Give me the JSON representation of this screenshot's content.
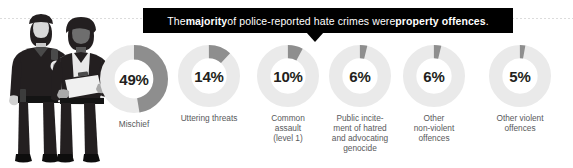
{
  "banner": {
    "prefix": "The ",
    "bold1": "majority",
    "middle": " of police-reported hate crimes were ",
    "bold2": "property offences",
    "suffix": "."
  },
  "illustration": {
    "name": "two-police-officers-illustration",
    "officer_left": "male police officer with badge and radio",
    "officer_right": "female police officer holding clipboard"
  },
  "colors": {
    "banner_background": "#000000",
    "banner_text": "#ffffff",
    "arc_active": "#8e8e8e",
    "arc_track": "#eaeaea",
    "percent_text": "#231f20",
    "label_text": "#58595b"
  },
  "chart_data": {
    "type": "pie",
    "title": "The majority of police-reported hate crimes were property offences.",
    "legend_position": "below-each",
    "unit": "%",
    "categories": [
      "Mischief",
      "Uttering threats",
      "Common assault (level 1)",
      "Public incitement of hatred and advocating genocide",
      "Other non-violent offences",
      "Other violent offences"
    ],
    "values": [
      49,
      14,
      10,
      6,
      6,
      5
    ],
    "donuts": [
      {
        "value": 49,
        "value_text": "49%",
        "label_lines": [
          "Mischief"
        ],
        "cx": 134,
        "size": 68
      },
      {
        "value": 14,
        "value_text": "14%",
        "label_lines": [
          "Uttering threats"
        ],
        "cx": 209,
        "size": 62
      },
      {
        "value": 10,
        "value_text": "10%",
        "label_lines": [
          "Common",
          "assault",
          "(level 1)"
        ],
        "cx": 288,
        "size": 62
      },
      {
        "value": 6,
        "value_text": "6%",
        "label_lines": [
          "Public incite-",
          "ment of hatred",
          "and advocating",
          "genocide"
        ],
        "cx": 360,
        "size": 62
      },
      {
        "value": 6,
        "value_text": "6%",
        "label_lines": [
          "Other",
          "non-violent",
          "offences"
        ],
        "cx": 434,
        "size": 62
      },
      {
        "value": 5,
        "value_text": "5%",
        "label_lines": [
          "Other violent",
          "offences"
        ],
        "cx": 520,
        "size": 62
      }
    ]
  }
}
